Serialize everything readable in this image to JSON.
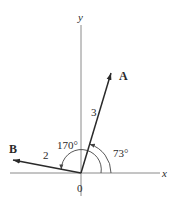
{
  "diagram": {
    "type": "vector-diagram",
    "axes": {
      "x_label": "x",
      "y_label": "y",
      "origin_label": "0"
    },
    "vectors": [
      {
        "name": "A",
        "magnitude_label": "3",
        "angle_deg": 73,
        "angle_label": "73°"
      },
      {
        "name": "B",
        "magnitude_label": "2",
        "angle_deg": 170,
        "angle_label": "170°"
      }
    ],
    "colors": {
      "axis": "#8a8a8a",
      "vector": "#2a2a2a",
      "arc": "#444444",
      "text": "#2a2a2a",
      "background": "#ffffff"
    }
  }
}
